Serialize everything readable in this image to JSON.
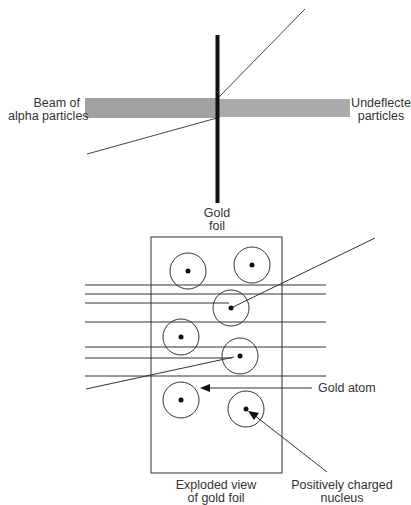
{
  "top_diagram": {
    "beam_label": [
      "Beam of",
      "alpha particles"
    ],
    "undeflected_label": [
      "Undeflecte",
      "particles"
    ],
    "foil_label": [
      "Gold",
      "foil"
    ]
  },
  "exploded_view": {
    "caption": [
      "Exploded view",
      "of gold foil"
    ],
    "gold_atom_label": "Gold atom",
    "nucleus_label": [
      "Positively charged",
      "nucleus"
    ],
    "atom_count": 7
  },
  "colors": {
    "stroke": "#333333",
    "foil": "#111111",
    "background": "#ffffff"
  }
}
